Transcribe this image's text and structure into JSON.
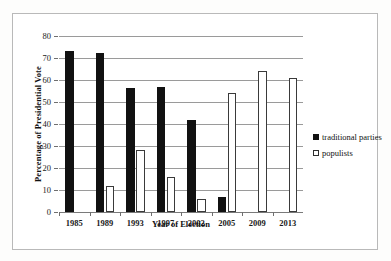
{
  "chart_data": {
    "type": "bar",
    "title": "",
    "xlabel": "Year of Election",
    "ylabel": "Percentage of Presidential Vote",
    "categories": [
      "1985",
      "1989",
      "1993",
      "1997",
      "2002",
      "2005",
      "2009",
      "2013"
    ],
    "series": [
      {
        "name": "traditional parties",
        "color": "#111111",
        "fill": "solid",
        "values": [
          73,
          72.5,
          56.5,
          57,
          42,
          7,
          0,
          0
        ]
      },
      {
        "name": "populists",
        "color": "#ffffff",
        "fill": "outline",
        "values": [
          0,
          12,
          28,
          16,
          6,
          54,
          64,
          61
        ]
      }
    ],
    "ylim": [
      0,
      80
    ],
    "ytick_values": [
      0,
      10,
      20,
      30,
      40,
      50,
      60,
      70,
      80
    ],
    "ytick_labels": [
      "0",
      "10",
      "20",
      "30",
      "40",
      "50",
      "60",
      "70",
      "80"
    ],
    "grid": true,
    "grid_axis": "y",
    "legend_position": "right",
    "legend_entries": [
      "traditional parties",
      "populists"
    ]
  },
  "axes": {
    "y_title": "Percentage of Presidential Vote",
    "x_title": "Year of Election"
  }
}
